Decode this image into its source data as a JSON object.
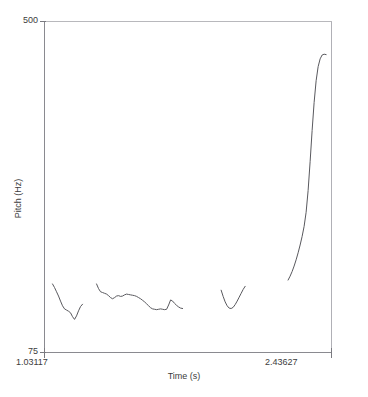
{
  "figure": {
    "name": "pitch-contour-plot",
    "background": "#ffffff",
    "line_color": "#59595e",
    "frame_color": "#7a7a80"
  },
  "axes": {
    "y_axis": {
      "title": "Pitch (Hz)",
      "unit": "Hz",
      "max_label": "500",
      "min_label": "75",
      "max_value": 500,
      "min_value": 75
    },
    "x_axis": {
      "title": "Time (s)",
      "unit": "s",
      "min_label": "1.03117",
      "max_label": "2.43627",
      "min_value": 1.03117,
      "max_value": 2.43627
    }
  },
  "chart_data": {
    "type": "line",
    "title": "",
    "xlabel": "Time (s)",
    "ylabel": "Pitch (Hz)",
    "xlim": [
      1.03117,
      2.43627
    ],
    "ylim": [
      75,
      500
    ],
    "grid": false,
    "legend": "none",
    "series": [
      {
        "name": "pitch-segment-1",
        "points": [
          [
            1.0704,
            163.0
          ],
          [
            1.0802,
            158.5
          ],
          [
            1.09,
            153.0
          ],
          [
            1.0998,
            147.5
          ],
          [
            1.1096,
            141.0
          ],
          [
            1.1194,
            135.0
          ],
          [
            1.1292,
            131.0
          ],
          [
            1.139,
            129.5
          ],
          [
            1.1488,
            128.0
          ],
          [
            1.1586,
            126.0
          ],
          [
            1.1684,
            121.0
          ],
          [
            1.1782,
            117.5
          ],
          [
            1.188,
            122.0
          ],
          [
            1.1978,
            128.5
          ],
          [
            1.2076,
            134.0
          ],
          [
            1.2174,
            137.0
          ]
        ]
      },
      {
        "name": "pitch-segment-2",
        "points": [
          [
            1.286,
            163.0
          ],
          [
            1.2958,
            157.0
          ],
          [
            1.3056,
            153.0
          ],
          [
            1.3154,
            152.0
          ],
          [
            1.3252,
            151.0
          ],
          [
            1.335,
            150.0
          ],
          [
            1.3448,
            148.0
          ],
          [
            1.3546,
            145.5
          ],
          [
            1.3644,
            144.0
          ],
          [
            1.3742,
            145.5
          ],
          [
            1.384,
            147.5
          ],
          [
            1.3938,
            148.0
          ],
          [
            1.4036,
            147.0
          ],
          [
            1.4134,
            147.5
          ],
          [
            1.4232,
            149.0
          ],
          [
            1.433,
            150.0
          ],
          [
            1.4428,
            149.5
          ],
          [
            1.4526,
            149.0
          ],
          [
            1.4624,
            148.5
          ],
          [
            1.4722,
            148.0
          ],
          [
            1.482,
            147.0
          ],
          [
            1.4918,
            145.5
          ],
          [
            1.5016,
            144.0
          ],
          [
            1.5114,
            142.0
          ],
          [
            1.5212,
            140.0
          ],
          [
            1.531,
            137.5
          ],
          [
            1.5408,
            135.0
          ],
          [
            1.5506,
            132.5
          ],
          [
            1.5604,
            131.0
          ],
          [
            1.5702,
            130.5
          ],
          [
            1.58,
            130.0
          ],
          [
            1.5898,
            130.5
          ],
          [
            1.5996,
            131.0
          ],
          [
            1.6094,
            130.5
          ],
          [
            1.6192,
            130.0
          ],
          [
            1.629,
            130.5
          ],
          [
            1.6388,
            136.0
          ],
          [
            1.6486,
            142.5
          ],
          [
            1.6584,
            141.0
          ],
          [
            1.6682,
            138.0
          ],
          [
            1.678,
            135.5
          ],
          [
            1.6878,
            133.5
          ],
          [
            1.6976,
            132.0
          ],
          [
            1.7074,
            131.5
          ]
        ]
      },
      {
        "name": "pitch-segment-3",
        "points": [
          [
            1.896,
            155.0
          ],
          [
            1.9058,
            147.0
          ],
          [
            1.9156,
            140.0
          ],
          [
            1.9254,
            135.0
          ],
          [
            1.9352,
            132.0
          ],
          [
            1.945,
            131.5
          ],
          [
            1.9548,
            133.0
          ],
          [
            1.9646,
            136.5
          ],
          [
            1.9744,
            141.0
          ],
          [
            1.9842,
            146.0
          ],
          [
            1.994,
            151.0
          ],
          [
            2.0038,
            156.0
          ],
          [
            2.0136,
            160.0
          ]
        ]
      },
      {
        "name": "pitch-segment-4",
        "points": [
          [
            2.2238,
            168.0
          ],
          [
            2.2336,
            173.0
          ],
          [
            2.2434,
            179.0
          ],
          [
            2.2532,
            186.0
          ],
          [
            2.263,
            194.0
          ],
          [
            2.2728,
            203.0
          ],
          [
            2.2826,
            213.0
          ],
          [
            2.2924,
            224.0
          ],
          [
            2.3022,
            237.0
          ],
          [
            2.312,
            255.0
          ],
          [
            2.3218,
            283.0
          ],
          [
            2.3316,
            320.0
          ],
          [
            2.3414,
            360.0
          ],
          [
            2.3512,
            396.0
          ],
          [
            2.361,
            424.0
          ],
          [
            2.3708,
            442.0
          ],
          [
            2.3806,
            452.0
          ],
          [
            2.3904,
            457.0
          ],
          [
            2.4002,
            458.0
          ],
          [
            2.41,
            457.5
          ]
        ]
      }
    ]
  }
}
